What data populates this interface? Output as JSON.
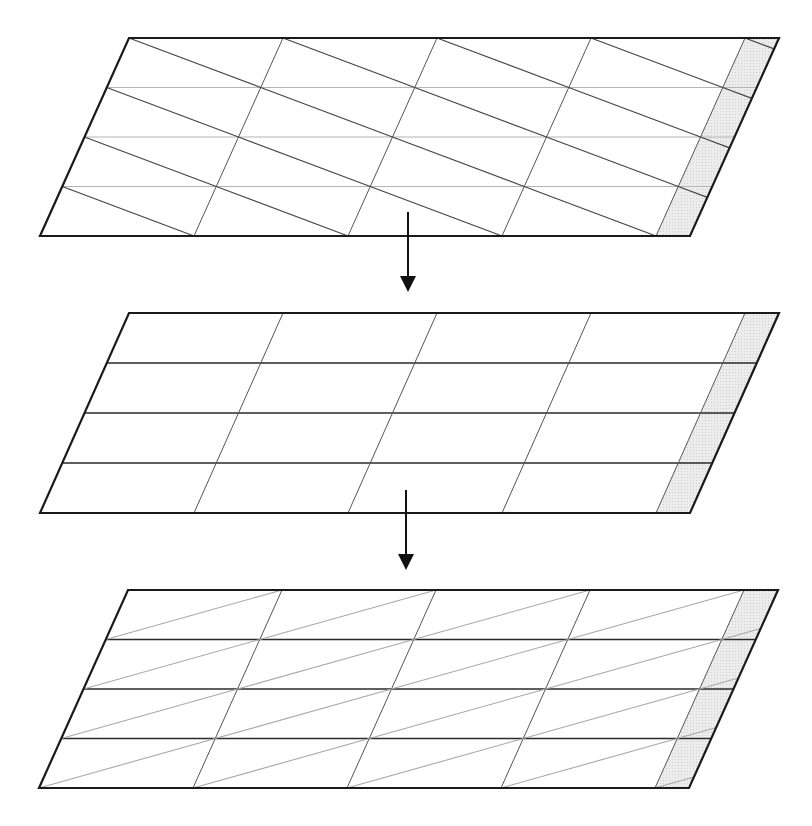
{
  "diagram": {
    "colors": {
      "outline": "#1a1a1a",
      "grid_dark": "#2a2a2a",
      "grid_light": "#b5b5b5",
      "diagonal_dark": "#444444",
      "diagonal_light": "#a8a8a8",
      "shade": "#e6e6e6"
    },
    "grid": {
      "columns": 4,
      "rows": 4,
      "shaded_strip": "right edge"
    },
    "panels": [
      {
        "id": "top",
        "top_y": 38,
        "height": 198,
        "left_top_x": 129,
        "skew": 89,
        "width": 650,
        "horizontal_lines": "light",
        "diagonals": "down-right, dark"
      },
      {
        "id": "middle",
        "top_y": 313,
        "height": 200,
        "left_top_x": 129,
        "skew": 89,
        "width": 650,
        "horizontal_lines": "dark",
        "diagonals": "none"
      },
      {
        "id": "bottom",
        "top_y": 590,
        "height": 198,
        "left_top_x": 128,
        "skew": 89,
        "width": 650,
        "horizontal_lines": "dark",
        "diagonals": "up-right, light"
      }
    ],
    "arrows": [
      {
        "id": "arrow-1",
        "x": 408,
        "from_y": 212,
        "to_y": 290
      },
      {
        "id": "arrow-2",
        "x": 406,
        "from_y": 490,
        "to_y": 568
      }
    ]
  }
}
